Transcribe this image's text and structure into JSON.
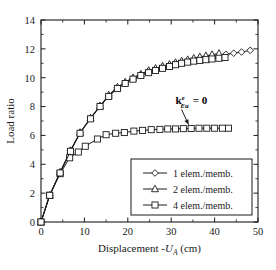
{
  "chart_data": {
    "type": "line",
    "title": "",
    "xlabel": "Displacement -U_A (cm)",
    "xlabel_parts": {
      "main": "Displacement",
      "symbol_prefix": "-",
      "symbol": "U",
      "symbol_subscript": "A",
      "units": "(cm)"
    },
    "ylabel": "Load ratio",
    "xlim": [
      0,
      50
    ],
    "ylim": [
      0,
      14
    ],
    "xticks": [
      0,
      10,
      20,
      30,
      40,
      50
    ],
    "xticklabels": [
      "0",
      "10",
      "20",
      "30",
      "40",
      "50"
    ],
    "xminor_step": 5,
    "yticks": [
      0,
      2,
      4,
      6,
      8,
      10,
      12,
      14
    ],
    "yticklabels": [
      "0",
      "2",
      "4",
      "6",
      "8",
      "10",
      "12",
      "14"
    ],
    "yminor_step": 1,
    "grid": false,
    "legend_position": "lower right",
    "annotations": [
      {
        "text": "k_Eu^e = 0",
        "base": "k",
        "subscript": "Eu",
        "superscript": "e",
        "equals": "= 0",
        "bold": true,
        "x_data": 31.0,
        "y_data": 8.15,
        "arrow_to_x_data": 34.0,
        "arrow_to_y_data": 6.75
      }
    ],
    "series": [
      {
        "name": "1 elem./memb.",
        "marker": "diamond",
        "x": [
          0.0,
          2.0,
          4.4,
          6.8,
          9.0,
          11.4,
          13.6,
          15.6,
          17.6,
          19.4,
          21.2,
          23.0,
          24.8,
          26.4,
          28.0,
          29.6,
          31.0,
          32.4,
          33.8,
          35.2,
          36.6,
          38.0,
          39.4,
          41.0,
          42.6,
          44.4,
          46.2,
          48.2
        ],
        "y": [
          0.0,
          1.85,
          3.45,
          4.95,
          6.2,
          7.2,
          8.05,
          8.75,
          9.3,
          9.65,
          9.95,
          10.2,
          10.45,
          10.6,
          10.75,
          10.88,
          11.0,
          11.08,
          11.18,
          11.25,
          11.33,
          11.4,
          11.48,
          11.55,
          11.62,
          11.7,
          11.78,
          11.9
        ]
      },
      {
        "name": "2 elem./memb.",
        "marker": "triangle",
        "x": [
          0.0,
          2.0,
          4.4,
          6.8,
          9.0,
          11.4,
          13.6,
          15.6,
          17.6,
          19.4,
          21.2,
          23.0,
          24.8,
          26.4,
          28.0,
          29.6,
          31.0,
          32.4,
          33.8,
          35.2,
          36.6,
          38.0,
          39.4,
          41.0
        ],
        "y": [
          0.0,
          1.85,
          3.45,
          4.95,
          6.2,
          7.2,
          8.05,
          8.8,
          9.35,
          9.7,
          10.0,
          10.25,
          10.5,
          10.65,
          10.8,
          10.92,
          11.05,
          11.15,
          11.25,
          11.35,
          11.45,
          11.52,
          11.6,
          11.68
        ]
      },
      {
        "name": "4 elem./memb.",
        "marker": "square",
        "x": [
          0.0,
          2.0,
          4.4,
          6.6,
          8.6,
          10.2,
          13.0,
          15.0,
          17.2,
          19.2,
          21.4,
          23.4,
          25.4,
          27.4,
          29.2,
          31.0,
          32.8,
          34.6,
          36.4,
          38.2,
          40.0,
          41.8,
          43.2
        ],
        "y": [
          0.0,
          1.85,
          3.35,
          4.45,
          4.85,
          5.25,
          5.75,
          6.05,
          6.15,
          6.2,
          6.3,
          6.35,
          6.4,
          6.42,
          6.45,
          6.45,
          6.47,
          6.48,
          6.5,
          6.5,
          6.5,
          6.5,
          6.5
        ]
      },
      {
        "name": "4 elem./memb. upper branch",
        "marker": "square",
        "hidden_in_legend": true,
        "x": [
          0.0,
          2.0,
          4.4,
          6.8,
          9.0,
          11.4,
          13.6,
          15.6,
          17.6,
          19.4,
          21.2,
          23.0,
          24.8,
          26.4,
          28.0,
          29.6,
          31.0,
          32.4,
          33.8,
          35.2,
          36.6,
          38.0,
          39.4,
          41.0,
          42.4
        ],
        "y": [
          0.0,
          1.85,
          3.4,
          4.9,
          6.15,
          7.15,
          8.0,
          8.7,
          9.25,
          9.6,
          9.9,
          10.15,
          10.35,
          10.5,
          10.65,
          10.78,
          10.9,
          11.0,
          11.08,
          11.15,
          11.2,
          11.25,
          11.3,
          11.35,
          11.4
        ]
      }
    ],
    "legend": [
      {
        "label": "1 elem./memb.",
        "marker": "diamond"
      },
      {
        "label": "2 elem./memb.",
        "marker": "triangle"
      },
      {
        "label": "4 elem./memb.",
        "marker": "square"
      }
    ]
  },
  "colors": {
    "line": "#1a1a1a",
    "marker_fill": "#ffffff",
    "background": "#ffffff",
    "axis": "#1a1a1a"
  }
}
